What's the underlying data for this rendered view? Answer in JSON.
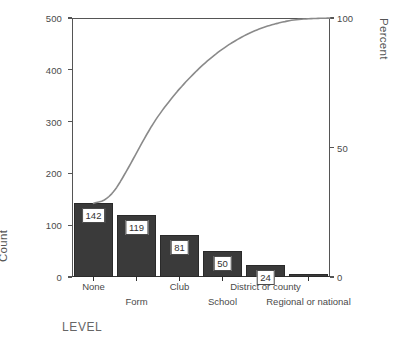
{
  "chart_data": {
    "type": "bar",
    "title": "",
    "subtitle": "",
    "xlabel": "LEVEL",
    "ylabel": "Count",
    "y2label": "Percent",
    "categories": [
      "None",
      "Form",
      "Club",
      "School",
      "District or county",
      "Regional or national"
    ],
    "values": [
      142,
      119,
      81,
      50,
      24,
      6
    ],
    "bar_labels": [
      "142",
      "119",
      "81",
      "50",
      "24",
      ""
    ],
    "cumulative_percent": [
      33.7,
      62.0,
      81.2,
      93.1,
      98.8,
      100.0
    ],
    "cumulative_counts": [
      142,
      261,
      342,
      392,
      416,
      422
    ],
    "total": 422,
    "ylim": [
      0,
      500
    ],
    "yticks": [
      0,
      100,
      200,
      300,
      400,
      500
    ],
    "ytick_labels": [
      "0",
      "100",
      "200",
      "300",
      "400",
      "500"
    ],
    "y2lim": [
      0,
      100
    ],
    "y2ticks": [
      0,
      50,
      100
    ],
    "y2tick_labels": [
      "0",
      "50",
      "100"
    ],
    "grid": false,
    "legend": "none",
    "bar_color": "#3a3a3a",
    "line_color": "#8a8a8a",
    "axis_color": "#555555",
    "label_box_fill": "#ffffff"
  },
  "axes": {
    "count_title": "Count",
    "percent_title": "Percent",
    "level_title": "LEVEL"
  }
}
